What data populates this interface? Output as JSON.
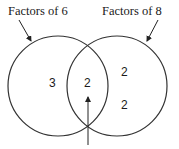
{
  "diagram": {
    "type": "venn",
    "sets": [
      {
        "label": "Factors of 6",
        "only_value": "3"
      },
      {
        "label": "Factors of 8",
        "only_values": [
          "2",
          "2"
        ]
      }
    ],
    "intersection_value": "2",
    "annotations": {
      "left_label": "Factors of 6",
      "right_label": "Factors of 8",
      "left_only": "3",
      "middle": "2",
      "right_top": "2",
      "right_bottom": "2"
    },
    "colors": {
      "stroke": "#333333",
      "background": "#ffffff"
    }
  }
}
